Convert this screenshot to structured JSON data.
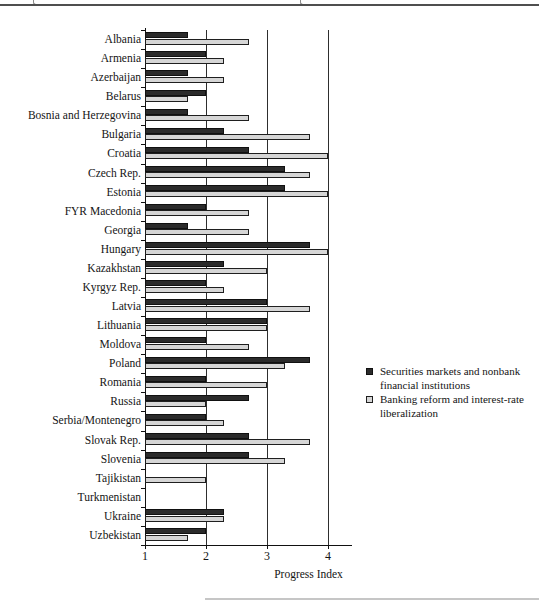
{
  "figure": {
    "axis_title": "Progress Index"
  },
  "chart_data": {
    "type": "bar",
    "orientation": "horizontal",
    "title": "",
    "xlabel": "Progress Index",
    "ylabel": "",
    "xlim": [
      1,
      4.33
    ],
    "x_ticks": [
      1,
      2,
      3,
      4
    ],
    "gridlines_at": [
      2,
      3,
      4
    ],
    "grid": "vertical-lines-on",
    "legend_position": "right-middle",
    "categories": [
      "Albania",
      "Armenia",
      "Azerbaijan",
      "Belarus",
      "Bosnia and Herzegovina",
      "Bulgaria",
      "Croatia",
      "Czech Rep.",
      "Estonia",
      "FYR Macedonia",
      "Georgia",
      "Hungary",
      "Kazakhstan",
      "Kyrgyz Rep.",
      "Latvia",
      "Lithuania",
      "Moldova",
      "Poland",
      "Romania",
      "Russia",
      "Serbia/Montenegro",
      "Slovak Rep.",
      "Slovenia",
      "Tajikistan",
      "Turkmenistan",
      "Ukraine",
      "Uzbekistan"
    ],
    "series": [
      {
        "name": "Securities markets and nonbank financial institutions",
        "color": "#2b2b2b",
        "values": [
          1.7,
          2.0,
          1.7,
          2.0,
          1.7,
          2.3,
          2.7,
          3.3,
          3.3,
          2.0,
          1.7,
          3.7,
          2.3,
          2.0,
          3.0,
          3.0,
          2.0,
          3.7,
          2.0,
          2.7,
          2.0,
          2.7,
          2.7,
          1.0,
          1.0,
          2.3,
          2.0
        ]
      },
      {
        "name": "Banking reform and interest-rate liberalization",
        "color": "#d6d6d6",
        "values": [
          2.7,
          2.3,
          2.3,
          1.7,
          2.7,
          3.7,
          4.0,
          3.7,
          4.0,
          2.7,
          2.7,
          4.0,
          3.0,
          2.3,
          3.7,
          3.0,
          2.7,
          3.3,
          3.0,
          2.0,
          2.3,
          3.7,
          3.3,
          2.0,
          1.0,
          2.3,
          1.7
        ]
      }
    ],
    "value_baseline": 1.0
  },
  "colors": {
    "series_dark": "#2b2b2b",
    "series_light": "#d6d6d6",
    "axis": "#111111",
    "gridline": "#2e2e2e",
    "top_rule": "#4f4f4f"
  }
}
